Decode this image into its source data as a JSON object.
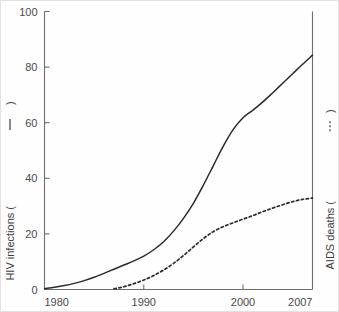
{
  "chart_data": {
    "type": "line",
    "title": "",
    "subtitle": "",
    "xlabel": "",
    "ylabel": "HIV infections",
    "ylabel_right": "AIDS deaths",
    "grid": false,
    "legend_position": "axis-labels",
    "xlim": [
      1980,
      2007
    ],
    "ylim": [
      0,
      100
    ],
    "ylim_right": [
      0,
      100
    ],
    "xticks": [
      1980,
      1990,
      2000,
      2007
    ],
    "xtick_labels": [
      "1980",
      "1990",
      "2000",
      "2007"
    ],
    "yticks": [
      0,
      20,
      40,
      60,
      80,
      100
    ],
    "ytick_labels": [
      "0",
      "20",
      "40",
      "60",
      "80",
      "100"
    ],
    "series": [
      {
        "name": "HIV infections",
        "style": "solid",
        "legend_marker": "solid-line",
        "axis": "left",
        "x": [
          1980,
          1981,
          1982,
          1983,
          1984,
          1985,
          1986,
          1987,
          1988,
          1989,
          1990,
          1991,
          1992,
          1993,
          1994,
          1995,
          1996,
          1997,
          1998,
          1999,
          2000,
          2001,
          2002,
          2003,
          2004,
          2005,
          2006,
          2007
        ],
        "values": [
          0.3,
          0.8,
          1.4,
          2.2,
          3.2,
          4.4,
          5.8,
          7.3,
          8.8,
          10.3,
          12.0,
          14.3,
          17.2,
          21.0,
          25.6,
          31.0,
          37.5,
          44.5,
          51.5,
          57.5,
          61.8,
          64.5,
          67.5,
          70.8,
          74.2,
          77.6,
          81.0,
          84.3
        ]
      },
      {
        "name": "AIDS deaths",
        "style": "dashed",
        "legend_marker": "dashed-line",
        "axis": "right",
        "x": [
          1987,
          1988,
          1989,
          1990,
          1991,
          1992,
          1993,
          1994,
          1995,
          1996,
          1997,
          1998,
          1999,
          2000,
          2001,
          2002,
          2003,
          2004,
          2005,
          2006,
          2007
        ],
        "values": [
          0.2,
          1.0,
          2.1,
          3.4,
          5.0,
          7.0,
          9.4,
          12.2,
          15.3,
          18.3,
          20.8,
          22.6,
          24.0,
          25.3,
          26.6,
          28.0,
          29.3,
          30.5,
          31.6,
          32.4,
          32.9
        ]
      }
    ]
  },
  "axes": {
    "left_title_text": "HIV infections (",
    "left_title_close": ")",
    "right_title_text": "AIDS deaths (",
    "right_title_close": ")"
  }
}
